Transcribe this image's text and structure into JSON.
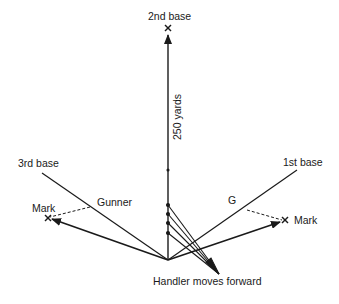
{
  "diagram": {
    "labels": {
      "second_base": "2nd base",
      "distance": "250 yards",
      "third_base": "3rd base",
      "first_base": "1st base",
      "gunner": "Gunner",
      "gunner_short": "G",
      "mark_left": "Mark",
      "mark_right": "Mark",
      "handler": "Handler moves forward"
    },
    "colors": {
      "line": "#1a1a1a",
      "background": "#ffffff"
    }
  }
}
